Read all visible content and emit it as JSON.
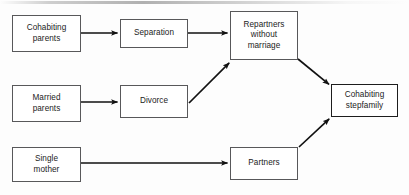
{
  "diagram": {
    "background_color": "#fdfdfd",
    "line_color": "#111111",
    "box_border_color": "#58585a",
    "emphasis_border_color": "#1d1d1d",
    "text_color": "#1b1b1b",
    "nodes": [
      {
        "id": "cohabiting-parents",
        "label": "Cohabiting\nparents",
        "x": 12,
        "y": 15,
        "w": 69,
        "h": 37,
        "emphasis": false
      },
      {
        "id": "separation",
        "label": "Separation",
        "x": 120,
        "y": 19,
        "w": 68,
        "h": 29,
        "emphasis": false
      },
      {
        "id": "repartners-without-marriage",
        "label": "Repartners\nwithout\nmarriage",
        "x": 230,
        "y": 11,
        "w": 68,
        "h": 49,
        "emphasis": false
      },
      {
        "id": "married-parents",
        "label": "Married\nparents",
        "x": 12,
        "y": 85,
        "w": 69,
        "h": 37,
        "emphasis": false
      },
      {
        "id": "divorce",
        "label": "Divorce",
        "x": 120,
        "y": 85,
        "w": 68,
        "h": 33,
        "emphasis": false
      },
      {
        "id": "cohabiting-stepfamily",
        "label": "Cohabiting\nstepfamily",
        "x": 331,
        "y": 84,
        "w": 67,
        "h": 33,
        "emphasis": true
      },
      {
        "id": "single-mother",
        "label": "Single\nmother",
        "x": 12,
        "y": 147,
        "w": 69,
        "h": 35,
        "emphasis": false
      },
      {
        "id": "partners",
        "label": "Partners",
        "x": 230,
        "y": 147,
        "w": 68,
        "h": 33,
        "emphasis": false
      }
    ],
    "edges": [
      {
        "id": "cohabiting-parents-to-separation",
        "from": "cohabiting-parents",
        "to": "separation",
        "kind": "straight-horizontal",
        "x1": 81,
        "y1": 33,
        "x2": 119,
        "y2": 33
      },
      {
        "id": "separation-to-repartners",
        "from": "separation",
        "to": "repartners-without-marriage",
        "kind": "straight-horizontal",
        "x1": 188,
        "y1": 33,
        "x2": 229,
        "y2": 33
      },
      {
        "id": "married-parents-to-divorce",
        "from": "married-parents",
        "to": "divorce",
        "kind": "straight-horizontal",
        "x1": 81,
        "y1": 102,
        "x2": 119,
        "y2": 102
      },
      {
        "id": "divorce-to-repartners",
        "from": "divorce",
        "to": "repartners-without-marriage",
        "kind": "diagonal-up",
        "x1": 189,
        "y1": 103,
        "x2": 231,
        "y2": 61
      },
      {
        "id": "repartners-to-cohabiting-stepfamily",
        "from": "repartners-without-marriage",
        "to": "cohabiting-stepfamily",
        "kind": "diagonal-down",
        "x1": 298,
        "y1": 59,
        "x2": 331,
        "y2": 86
      },
      {
        "id": "single-mother-to-partners",
        "from": "single-mother",
        "to": "partners",
        "kind": "straight-horizontal",
        "x1": 81,
        "y1": 163,
        "x2": 229,
        "y2": 163
      },
      {
        "id": "partners-to-cohabiting-stepfamily",
        "from": "partners",
        "to": "cohabiting-stepfamily",
        "kind": "diagonal-up",
        "x1": 299,
        "y1": 147,
        "x2": 331,
        "y2": 117
      }
    ]
  }
}
